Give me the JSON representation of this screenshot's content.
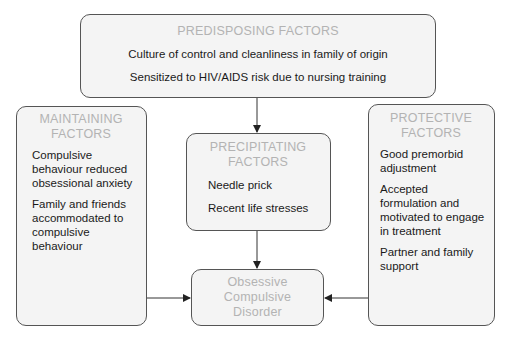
{
  "predisposing": {
    "heading": "PREDISPOSING FACTORS",
    "items": [
      "Culture of control and cleanliness in family of origin",
      "Sensitized to HIV/AIDS risk due to nursing training"
    ]
  },
  "maintaining": {
    "heading": "MAINTAINING FACTORS",
    "items": [
      "Compulsive behaviour reduced obsessional anxiety",
      "Family and friends accommodated to compulsive behaviour"
    ]
  },
  "precipitating": {
    "heading": "PRECIPITATING FACTORS",
    "items": [
      "Needle prick",
      "Recent life stresses"
    ]
  },
  "protective": {
    "heading": "PROTECTIVE FACTORS",
    "items": [
      "Good premorbid adjustment",
      "Accepted formulation and motivated to engage in treatment",
      "Partner and family support"
    ]
  },
  "outcome": {
    "label": "Obsessive Compulsive Disorder"
  },
  "colors": {
    "heading_text": "#b3b3b3",
    "body_text": "#1a1a1a",
    "box_fill": "#f4f4f4",
    "box_border": "#555555"
  }
}
